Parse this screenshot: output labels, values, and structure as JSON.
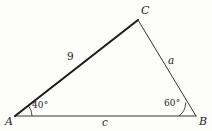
{
  "figure": {
    "type": "triangle-diagram",
    "stroke_color": "#1d1d1d",
    "background_color": "#fdfdfc",
    "vertices": [
      {
        "name": "A",
        "label": "A",
        "x": 15,
        "y": 116
      },
      {
        "name": "B",
        "label": "B",
        "x": 196,
        "y": 116
      },
      {
        "name": "C",
        "label": "C",
        "x": 138,
        "y": 20
      }
    ],
    "sides": [
      {
        "name": "AC",
        "label": "9",
        "emphasis": "bold",
        "stroke_width": 2.1
      },
      {
        "name": "BC",
        "label": "a",
        "emphasis": "normal",
        "stroke_width": 0.9
      },
      {
        "name": "AB",
        "label": "c",
        "emphasis": "normal",
        "stroke_width": 0.9
      }
    ],
    "angles": [
      {
        "at": "A",
        "label": "40°",
        "value": 40,
        "arc_radius": 17
      },
      {
        "at": "B",
        "label": "60°",
        "value": 60,
        "arc_radius": 17
      }
    ]
  }
}
